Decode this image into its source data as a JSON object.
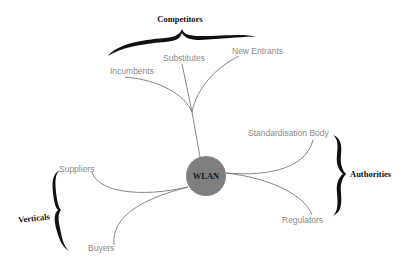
{
  "diagram": {
    "center": {
      "label": "WLAN",
      "color": "#7f7f7f"
    },
    "groups": [
      {
        "label": "Competitors",
        "members": [
          "Incumbents",
          "Substitutes",
          "New Entrants"
        ]
      },
      {
        "label": "Authorities",
        "members": [
          "Standardisation Body",
          "Regulators"
        ]
      },
      {
        "label": "Verticals",
        "members": [
          "Suppliers",
          "Buyers"
        ]
      }
    ],
    "nodes": {
      "incumbents": "Incumbents",
      "substitutes": "Substitutes",
      "new_entrants": "New Entrants",
      "standardisation_body": "Standardisation Body",
      "regulators": "Regulators",
      "suppliers": "Suppliers",
      "buyers": "Buyers"
    },
    "group_labels": {
      "competitors": "Competitors",
      "authorities": "Authorities",
      "verticals": "Verticals"
    }
  }
}
